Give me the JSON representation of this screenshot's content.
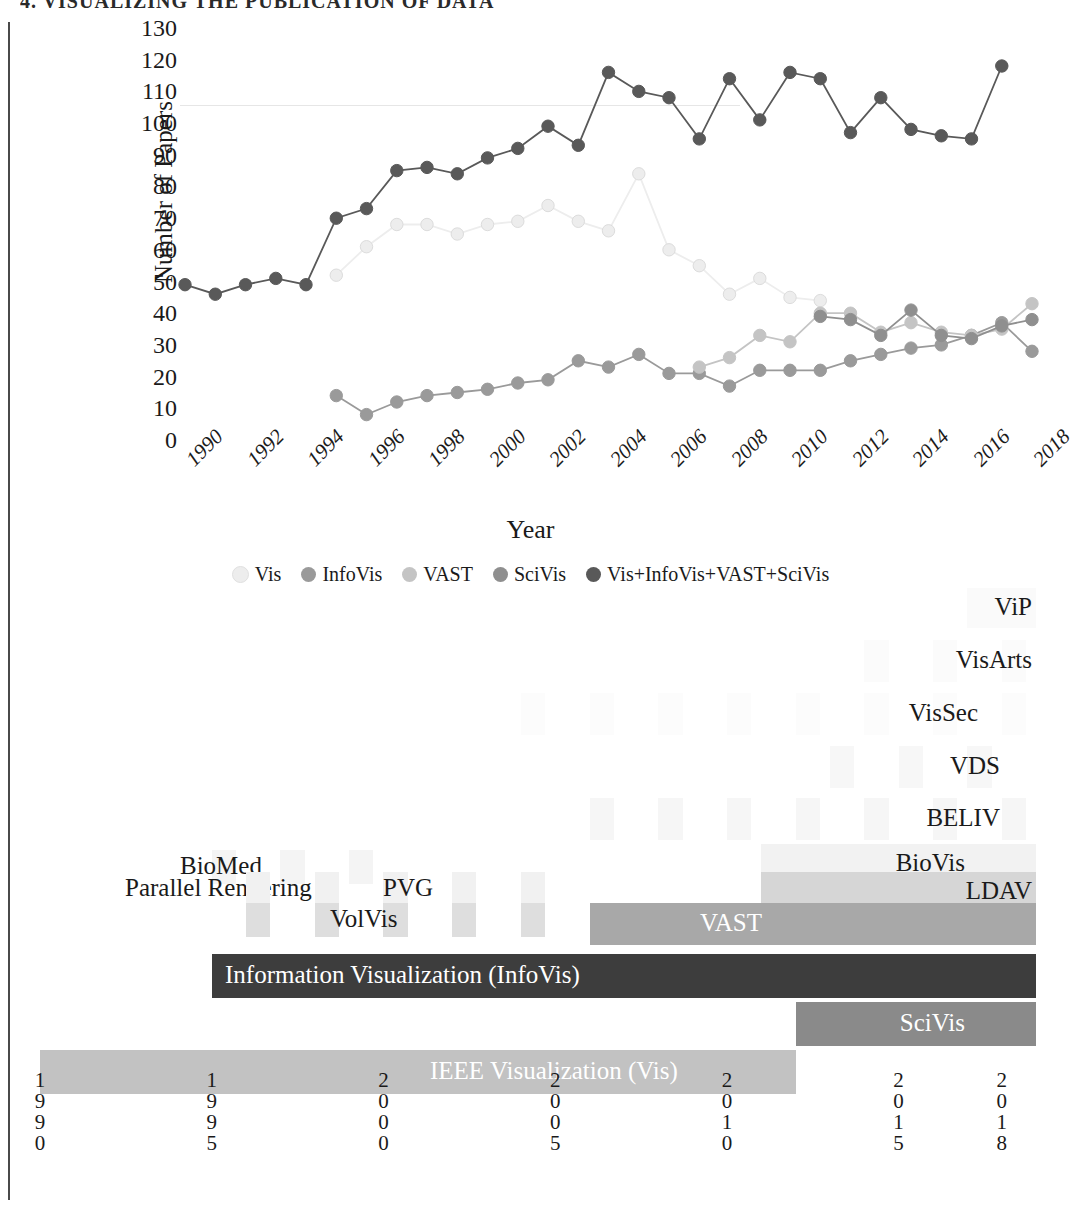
{
  "running_header": "4. VISUALIZING THE PUBLICATION OF DATA",
  "line_chart": {
    "ylabel": "Number of Papers",
    "xlabel": "Year",
    "yticks": [
      0,
      10,
      20,
      30,
      40,
      50,
      60,
      70,
      80,
      90,
      100,
      110,
      120,
      130
    ],
    "xticks": [
      "1990",
      "1992",
      "1994",
      "1996",
      "1998",
      "2000",
      "2002",
      "2004",
      "2006",
      "2008",
      "2010",
      "2012",
      "2014",
      "2016",
      "2018"
    ],
    "legend": [
      {
        "label": "Vis",
        "color": "#ededed"
      },
      {
        "label": "InfoVis",
        "color": "#9a9a9a"
      },
      {
        "label": "VAST",
        "color": "#c4c4c4"
      },
      {
        "label": "SciVis",
        "color": "#8f8f8f"
      },
      {
        "label": "Vis+InfoVis+VAST+SciVis",
        "color": "#595959"
      }
    ]
  },
  "chart_data": {
    "type": "line",
    "title": "",
    "xlabel": "Year",
    "ylabel": "Number of Papers",
    "xlim": [
      1990,
      2018
    ],
    "ylim": [
      0,
      130
    ],
    "grid": false,
    "legend_position": "bottom",
    "x": [
      1990,
      1991,
      1992,
      1993,
      1994,
      1995,
      1996,
      1997,
      1998,
      1999,
      2000,
      2001,
      2002,
      2003,
      2004,
      2005,
      2006,
      2007,
      2008,
      2009,
      2010,
      2011,
      2012,
      2013,
      2014,
      2015,
      2016,
      2017,
      2018
    ],
    "series": [
      {
        "name": "Vis",
        "color": "#ededed",
        "values": [
          null,
          null,
          null,
          null,
          null,
          52,
          61,
          68,
          68,
          65,
          68,
          69,
          74,
          69,
          66,
          84,
          60,
          55,
          46,
          51,
          45,
          44,
          null,
          null,
          null,
          null,
          null,
          null,
          null
        ]
      },
      {
        "name": "InfoVis",
        "color": "#9a9a9a",
        "values": [
          null,
          null,
          null,
          null,
          null,
          14,
          8,
          12,
          14,
          15,
          16,
          18,
          19,
          25,
          23,
          27,
          21,
          21,
          17,
          22,
          22,
          22,
          25,
          27,
          29,
          30,
          33,
          37,
          28
        ]
      },
      {
        "name": "VAST",
        "color": "#c4c4c4",
        "values": [
          null,
          null,
          null,
          null,
          null,
          null,
          null,
          null,
          null,
          null,
          null,
          null,
          null,
          null,
          null,
          null,
          null,
          23,
          26,
          33,
          31,
          40,
          40,
          34,
          37,
          34,
          33,
          35,
          43
        ]
      },
      {
        "name": "SciVis",
        "color": "#8f8f8f",
        "values": [
          null,
          null,
          null,
          null,
          null,
          null,
          null,
          null,
          null,
          null,
          null,
          null,
          null,
          null,
          null,
          null,
          null,
          null,
          null,
          null,
          null,
          39,
          38,
          33,
          41,
          33,
          32,
          36,
          38
        ]
      },
      {
        "name": "Vis+InfoVis+VAST+SciVis",
        "color": "#595959",
        "values": [
          49,
          46,
          49,
          51,
          49,
          70,
          73,
          85,
          86,
          84,
          89,
          92,
          99,
          93,
          116,
          110,
          108,
          95,
          114,
          101,
          116,
          114,
          97,
          108,
          98,
          96,
          95,
          118,
          null
        ]
      }
    ]
  },
  "timeline": {
    "rows": [
      {
        "name": "ViP",
        "label": "ViP",
        "label_x": 1032,
        "align": "right",
        "bars": [
          {
            "start": 2017,
            "end": 2019,
            "color": "#fafafa"
          }
        ],
        "segmented": false
      },
      {
        "name": "VisArts",
        "label": "VisArts",
        "label_x": 1032,
        "align": "right",
        "bars": [
          {
            "start": 2014,
            "end": 2019,
            "color": "#fbfbfb"
          }
        ],
        "segmented": true
      },
      {
        "name": "VisSec",
        "label": "VisSec",
        "label_x": 978,
        "align": "right",
        "bars": [
          {
            "start": 2004,
            "end": 2019,
            "color": "#fcfcfc"
          }
        ],
        "segmented": true
      },
      {
        "name": "VDS",
        "label": "VDS",
        "label_x": 1000,
        "align": "right",
        "bars": [
          {
            "start": 2013,
            "end": 2019,
            "color": "#f7f7f7"
          }
        ],
        "segmented": true
      },
      {
        "name": "BELIV",
        "label": "BELIV",
        "label_x": 1000,
        "align": "right",
        "bars": [
          {
            "start": 2006,
            "end": 2019,
            "color": "#f6f6f6"
          }
        ],
        "segmented": true
      },
      {
        "name": "BioVis",
        "label": "BioVis",
        "label_x": 965,
        "align": "right",
        "bars": [
          {
            "start": 2011,
            "end": 2019,
            "color": "#f2f2f2"
          }
        ],
        "segmented": false
      },
      {
        "name": "BioMed",
        "label": "BioMed",
        "label_x": 180,
        "align": "left",
        "bars": [
          {
            "start": 1995,
            "end": 2001,
            "color": "#f4f4f4"
          }
        ],
        "segmented": true
      },
      {
        "name": "LDAV",
        "label": "LDAV",
        "label_x": 1032,
        "align": "right",
        "bars": [
          {
            "start": 2011,
            "end": 2019,
            "color": "#d6d6d6"
          }
        ],
        "segmented": false
      },
      {
        "name": "ParallelRendering",
        "label": "Parallel Rendering",
        "label_x": 125,
        "align": "left",
        "bars": [
          {
            "start": 1996,
            "end": 2005,
            "color": "#f1f1f1"
          }
        ],
        "segmented": true
      },
      {
        "name": "PVG",
        "label": "PVG",
        "label_x": 383,
        "align": "left",
        "bars": [
          {
            "start": 1996,
            "end": 2005,
            "color": "#f1f1f1"
          }
        ],
        "segmented": true
      },
      {
        "name": "VAST",
        "label": "VAST",
        "label_x": 762,
        "align": "right",
        "bars": [
          {
            "start": 2006,
            "end": 2019,
            "color": "#a8a8a8"
          }
        ],
        "segmented": false
      },
      {
        "name": "VolVis",
        "label": "VolVis",
        "label_x": 330,
        "align": "left",
        "bars": [
          {
            "start": 1996,
            "end": 2006,
            "color": "#dedede"
          }
        ],
        "segmented": true
      },
      {
        "name": "InfoVis",
        "label": "Information Visualization (InfoVis)",
        "label_x": 225,
        "align": "left",
        "bars": [
          {
            "start": 1995,
            "end": 2019,
            "color": "#3d3d3d"
          }
        ],
        "segmented": false
      },
      {
        "name": "SciVis",
        "label": "SciVis",
        "label_x": 965,
        "align": "right",
        "bars": [
          {
            "start": 2012,
            "end": 2019,
            "color": "#8a8a8a"
          }
        ],
        "segmented": false
      },
      {
        "name": "IEEEVis",
        "label": "IEEE Visualization (Vis)",
        "label_x": 430,
        "align": "left",
        "bars": [
          {
            "start": 1990,
            "end": 2012,
            "color": "#c2c2c2"
          }
        ],
        "segmented": false
      }
    ],
    "year_axis": [
      "1990",
      "1995",
      "2000",
      "2005",
      "2010",
      "2015",
      "2018"
    ]
  }
}
